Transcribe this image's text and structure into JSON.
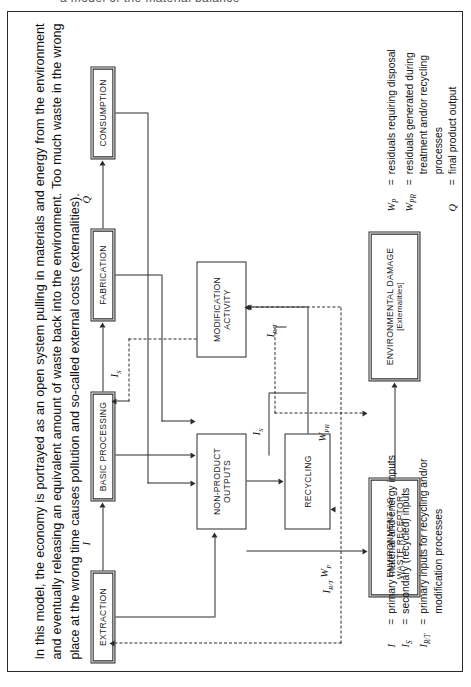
{
  "page": {
    "top_cutoff_text": "a model of the material balance",
    "caption": "In this model, the economy is portrayed as an open system pulling in materials and energy from the environment and eventually releasing an equivalent amount of waste back into the environment. Too much waste in the wrong place at the wrong time causes pollution and so-called external costs (externalities)."
  },
  "diagram": {
    "type": "flow-diagram",
    "boxes": [
      {
        "id": "extraction",
        "label": "EXTRACTION",
        "sub": ""
      },
      {
        "id": "basic-processing",
        "label": "BASIC PROCESSING",
        "sub": ""
      },
      {
        "id": "fabrication",
        "label": "FABRICATION",
        "sub": ""
      },
      {
        "id": "consumption",
        "label": "CONSUMPTION",
        "sub": ""
      },
      {
        "id": "non-product-outputs",
        "label": "NON-PRODUCT\nOUTPUTS",
        "sub": ""
      },
      {
        "id": "modification-activity",
        "label": "MODIFICATION\nACTIVITY",
        "sub": ""
      },
      {
        "id": "recycling",
        "label": "RECYCLING",
        "sub": ""
      },
      {
        "id": "environment-waste-receptor",
        "label": "ENVIRONMENT AS\nWASTE RECEPTOR",
        "sub": ""
      },
      {
        "id": "environmental-damage",
        "label": "ENVIRONMENTAL DAMAGE",
        "sub": "[Externalities]"
      }
    ],
    "flow_labels": {
      "i": "I",
      "is": "I",
      "is_sub": "S",
      "irt": "I",
      "irt_sub": "R/T",
      "q": "Q",
      "wp": "W",
      "wp_sub": "P",
      "wpr": "W",
      "wpr_sub": "PR"
    },
    "box_text": {
      "extraction": "EXTRACTION",
      "basic_processing": "BASIC PROCESSING",
      "fabrication": "FABRICATION",
      "consumption": "CONSUMPTION",
      "non_product_outputs_l1": "NON-PRODUCT",
      "non_product_outputs_l2": "OUTPUTS",
      "modification_activity_l1": "MODIFICATION",
      "modification_activity_l2": "ACTIVITY",
      "recycling": "RECYCLING",
      "environment_receptor_l1": "ENVIRONMENT AS",
      "environment_receptor_l2": "WASTE RECEPTOR",
      "environmental_damage_l1": "ENVIRONMENTAL DAMAGE",
      "environmental_damage_l2": "[Externalities]"
    }
  },
  "legend": {
    "left_column": [
      {
        "symbol": "I",
        "sub": "",
        "eq": "=",
        "text": "primary material and energy inputs"
      },
      {
        "symbol": "I",
        "sub": "S",
        "eq": "=",
        "text": "secondary (recycled) inputs"
      },
      {
        "symbol": "I",
        "sub": "R/T",
        "eq": "=",
        "text": "primary inputs for recycling and/or modification processes"
      }
    ],
    "right_column": [
      {
        "symbol": "W",
        "sub": "P",
        "eq": "=",
        "text": "residuals requiring disposal"
      },
      {
        "symbol": "W",
        "sub": "PR",
        "eq": "=",
        "text": "residuals generated during treatment and/or recycling processes"
      },
      {
        "symbol": "Q",
        "sub": "",
        "eq": "=",
        "text": "final product output"
      }
    ]
  },
  "colors": {
    "ink": "#2a2a2a",
    "text": "#111111",
    "background": "#ffffff"
  }
}
